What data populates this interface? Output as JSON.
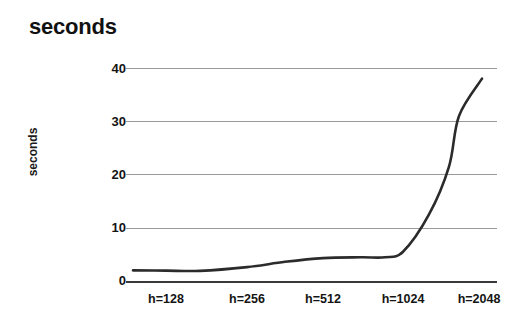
{
  "chart_data": {
    "type": "line",
    "title": "seconds",
    "xlabel": "",
    "ylabel": "seconds",
    "categories": [
      "h=128",
      "h=256",
      "h=512",
      "h=1024",
      "h=2048"
    ],
    "x": [
      128,
      256,
      512,
      1024,
      2048
    ],
    "values": [
      2.0,
      2.6,
      4.3,
      5.5,
      38.0
    ],
    "series": [
      {
        "name": "seconds",
        "values": [
          2.0,
          2.6,
          4.3,
          5.5,
          38.0
        ],
        "color": "#2b2b2b"
      }
    ],
    "ylim": [
      0,
      40
    ],
    "yticks": [
      0,
      10,
      20,
      30,
      40
    ],
    "ytick_labels": [
      "0",
      "10",
      "20",
      "30",
      "40"
    ],
    "grid": true,
    "legend": "none",
    "annotations": []
  },
  "chart": {
    "title": "seconds",
    "y_axis_label": "seconds",
    "y_ticks": [
      {
        "label": "40",
        "value": 40
      },
      {
        "label": "30",
        "value": 30
      },
      {
        "label": "20",
        "value": 20
      },
      {
        "label": "10",
        "value": 10
      },
      {
        "label": "0",
        "value": 0
      }
    ],
    "x_ticks": [
      {
        "label": "h=128",
        "value": 128
      },
      {
        "label": "h=256",
        "value": 256
      },
      {
        "label": "h=512",
        "value": 512
      },
      {
        "label": "h=1024",
        "value": 1024
      },
      {
        "label": "h=2048",
        "value": 2048
      }
    ],
    "colors": {
      "line": "#2b2b2b",
      "grid": "#9a9a9a",
      "axis": "#3a3a3a",
      "text": "#141414",
      "background": "#ffffff"
    }
  }
}
